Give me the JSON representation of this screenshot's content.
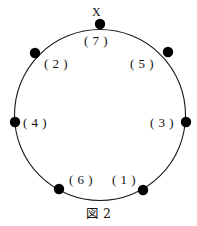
{
  "figure": {
    "caption": "図 2",
    "apex_marker": "X",
    "circle": {
      "center_x": 100,
      "center_y": 115,
      "radius": 85.5,
      "stroke_color": "#1a1a1a",
      "stroke_width": 1.1,
      "fill": "none"
    },
    "dot_style": {
      "color": "#000000",
      "radius": 5.2
    },
    "nodes": [
      {
        "label": "( 7 )",
        "name": "node-7",
        "dot_x": 100,
        "dot_y": 24,
        "label_x": 84,
        "label_y": 34
      },
      {
        "label": "( 2 )",
        "name": "node-2",
        "dot_x": 35,
        "dot_y": 53,
        "label_x": 44,
        "label_y": 57
      },
      {
        "label": "( 5 )",
        "name": "node-5",
        "dot_x": 168,
        "dot_y": 52,
        "label_x": 130,
        "label_y": 57
      },
      {
        "label": "( 4 )",
        "name": "node-4",
        "dot_x": 15,
        "dot_y": 122,
        "label_x": 23,
        "label_y": 116
      },
      {
        "label": "( 3 )",
        "name": "node-3",
        "dot_x": 186,
        "dot_y": 122,
        "label_x": 150,
        "label_y": 116
      },
      {
        "label": "( 6 )",
        "name": "node-6",
        "dot_x": 59,
        "dot_y": 189,
        "label_x": 69,
        "label_y": 173
      },
      {
        "label": "( 1 )",
        "name": "node-1",
        "dot_x": 143,
        "dot_y": 190,
        "label_x": 112,
        "label_y": 173
      }
    ],
    "apex": {
      "x": 92,
      "y": 6
    },
    "caption_y": 208
  }
}
